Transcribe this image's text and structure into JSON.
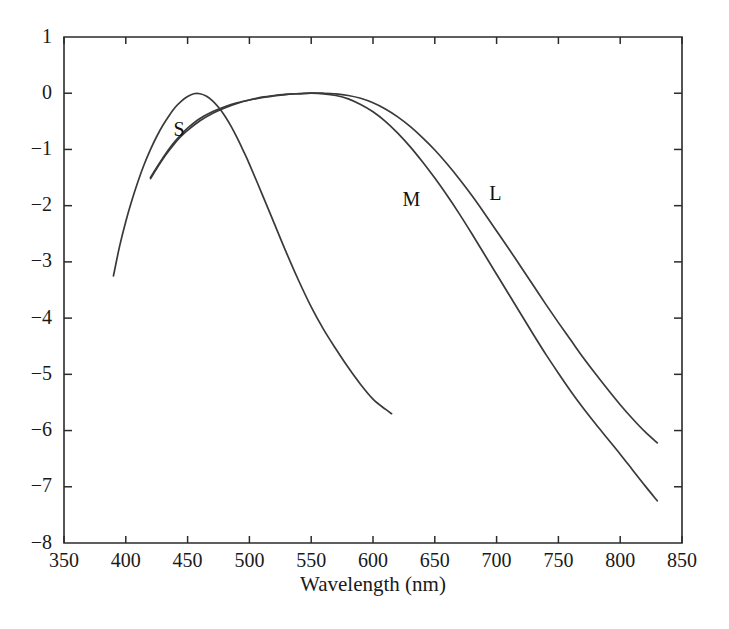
{
  "chart_data": {
    "type": "line",
    "title": "",
    "subtitle": "",
    "xlabel": "Wavelength (nm)",
    "ylabel": "",
    "xlim": [
      350,
      850
    ],
    "ylim": [
      -8,
      1
    ],
    "xticks": [
      350,
      400,
      450,
      500,
      550,
      600,
      650,
      700,
      750,
      800,
      850
    ],
    "yticks": [
      1,
      0,
      -1,
      -2,
      -3,
      -4,
      -5,
      -6,
      -7,
      -8
    ],
    "xtick_labels": [
      "350",
      "400",
      "450",
      "500",
      "550",
      "600",
      "650",
      "700",
      "750",
      "800",
      "850"
    ],
    "ytick_labels": [
      "1",
      "0",
      "−1",
      "−2",
      "−3",
      "−4",
      "−5",
      "−6",
      "−7",
      "−8"
    ],
    "grid": false,
    "legend": "inline-curve-labels",
    "annotations": [
      {
        "text": "S",
        "x": 443,
        "y": -0.68
      },
      {
        "text": "M",
        "x": 631,
        "y": -1.92
      },
      {
        "text": "L",
        "x": 699,
        "y": -1.81
      }
    ],
    "series": [
      {
        "name": "S",
        "label": "S",
        "color": "#3a3a3a",
        "x": [
          390,
          395,
          400,
          405,
          410,
          415,
          420,
          425,
          430,
          435,
          440,
          445,
          450,
          455,
          460,
          465,
          470,
          475,
          480,
          485,
          490,
          495,
          500,
          510,
          520,
          530,
          540,
          550,
          560,
          570,
          580,
          590,
          600,
          610,
          615
        ],
        "y": [
          -3.25,
          -2.72,
          -2.28,
          -1.9,
          -1.56,
          -1.26,
          -1.0,
          -0.77,
          -0.57,
          -0.4,
          -0.25,
          -0.14,
          -0.06,
          -0.01,
          -0.01,
          -0.05,
          -0.13,
          -0.25,
          -0.4,
          -0.58,
          -0.79,
          -1.02,
          -1.26,
          -1.78,
          -2.31,
          -2.84,
          -3.34,
          -3.8,
          -4.2,
          -4.55,
          -4.88,
          -5.18,
          -5.44,
          -5.62,
          -5.7
        ]
      },
      {
        "name": "M",
        "label": "M",
        "color": "#3a3a3a",
        "x": [
          420,
          425,
          430,
          435,
          440,
          445,
          450,
          460,
          470,
          480,
          490,
          500,
          510,
          520,
          530,
          540,
          550,
          560,
          570,
          580,
          590,
          600,
          610,
          620,
          630,
          640,
          650,
          660,
          670,
          680,
          690,
          700,
          710,
          720,
          730,
          740,
          750,
          760,
          770,
          780,
          790,
          800,
          810,
          820,
          830
        ],
        "y": [
          -1.52,
          -1.34,
          -1.17,
          -1.02,
          -0.88,
          -0.76,
          -0.66,
          -0.49,
          -0.36,
          -0.26,
          -0.18,
          -0.12,
          -0.07,
          -0.04,
          -0.02,
          -0.005,
          0.0,
          -0.01,
          -0.04,
          -0.1,
          -0.2,
          -0.33,
          -0.5,
          -0.71,
          -0.95,
          -1.22,
          -1.51,
          -1.82,
          -2.15,
          -2.5,
          -2.86,
          -3.22,
          -3.58,
          -3.94,
          -4.3,
          -4.65,
          -4.98,
          -5.3,
          -5.6,
          -5.88,
          -6.15,
          -6.42,
          -6.7,
          -6.98,
          -7.25
        ]
      },
      {
        "name": "L",
        "label": "L",
        "color": "#3a3a3a",
        "x": [
          420,
          425,
          430,
          435,
          440,
          445,
          450,
          460,
          470,
          480,
          490,
          500,
          510,
          520,
          530,
          540,
          550,
          560,
          570,
          580,
          590,
          600,
          610,
          620,
          630,
          640,
          650,
          660,
          670,
          680,
          690,
          700,
          710,
          720,
          730,
          740,
          750,
          760,
          770,
          780,
          790,
          800,
          810,
          820,
          830
        ],
        "y": [
          -1.5,
          -1.32,
          -1.15,
          -0.99,
          -0.85,
          -0.73,
          -0.62,
          -0.45,
          -0.33,
          -0.24,
          -0.17,
          -0.12,
          -0.08,
          -0.05,
          -0.02,
          -0.01,
          0.0,
          0.0,
          -0.01,
          -0.04,
          -0.09,
          -0.17,
          -0.28,
          -0.42,
          -0.59,
          -0.79,
          -1.01,
          -1.26,
          -1.53,
          -1.82,
          -2.13,
          -2.45,
          -2.77,
          -3.1,
          -3.43,
          -3.76,
          -4.08,
          -4.39,
          -4.7,
          -4.99,
          -5.27,
          -5.54,
          -5.79,
          -6.02,
          -6.22
        ]
      }
    ]
  },
  "axes": {
    "x_title": "Wavelength (nm)",
    "y_title": ""
  }
}
